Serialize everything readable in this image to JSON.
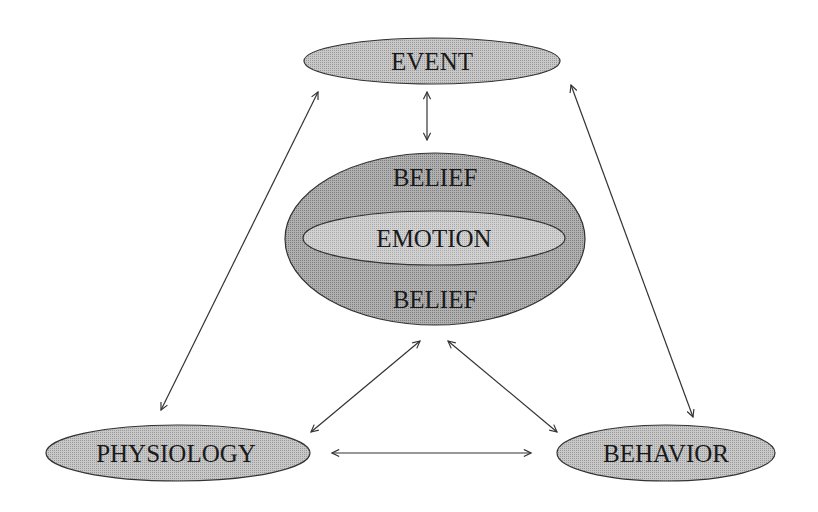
{
  "diagram": {
    "title": "",
    "colors": {
      "background": "#ffffff",
      "node_fill": "#bdbdbd",
      "belief_fill": "#a3a3a3",
      "emotion_fill": "#c4c4c4",
      "stroke": "#333333",
      "text": "#1a1a1a"
    },
    "nodes": {
      "event": {
        "label": "EVENT"
      },
      "belief_top": {
        "label": "BELIEF"
      },
      "emotion": {
        "label": "EMOTION"
      },
      "belief_bottom": {
        "label": "BELIEF"
      },
      "physiology": {
        "label": "PHYSIOLOGY"
      },
      "behavior": {
        "label": "BEHAVIOR"
      }
    },
    "edges": [
      {
        "from": "event",
        "to": "belief",
        "type": "bidirectional"
      },
      {
        "from": "event",
        "to": "physiology",
        "type": "bidirectional"
      },
      {
        "from": "event",
        "to": "behavior",
        "type": "bidirectional"
      },
      {
        "from": "belief",
        "to": "physiology",
        "type": "bidirectional"
      },
      {
        "from": "belief",
        "to": "behavior",
        "type": "bidirectional"
      },
      {
        "from": "physiology",
        "to": "behavior",
        "type": "bidirectional"
      }
    ]
  }
}
